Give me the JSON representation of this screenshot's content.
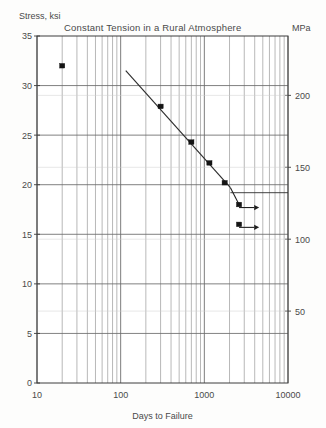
{
  "chart_data": {
    "type": "scatter",
    "title": "Constant Tension in a Rural Atmosphere",
    "xlabel": "Days to Failure",
    "ylabel": "Stress, ksi",
    "y2label": "MPa",
    "xscale": "log",
    "yscale": "linear",
    "xlim": [
      10,
      10000
    ],
    "ylim": [
      0,
      35
    ],
    "y2lim": [
      0,
      241.3
    ],
    "grid": true,
    "legend": "none",
    "xticks": [
      10,
      100,
      1000,
      10000
    ],
    "xtick_labels": [
      "10",
      "100",
      "1000",
      "10000"
    ],
    "yticks": [
      0,
      5,
      10,
      15,
      20,
      25,
      30,
      35
    ],
    "ytick_labels": [
      "0",
      "5",
      "10",
      "15",
      "20",
      "25",
      "30",
      "35"
    ],
    "y2ticks": [
      50,
      100,
      150,
      200
    ],
    "y2tick_labels": [
      "50",
      "100",
      "150",
      "200"
    ],
    "series": [
      {
        "name": "Failures",
        "marker": "filled-square",
        "points": [
          {
            "x": 20,
            "y": 32.0,
            "label": ""
          },
          {
            "x": 300,
            "y": 27.9,
            "label": ""
          },
          {
            "x": 700,
            "y": 24.3,
            "label": ""
          },
          {
            "x": 1150,
            "y": 22.2,
            "label": ""
          },
          {
            "x": 1750,
            "y": 20.2,
            "label": ""
          },
          {
            "x": 2600,
            "y": 18.0,
            "label": ""
          },
          {
            "x": 2600,
            "y": 16.0,
            "label": ""
          }
        ]
      }
    ],
    "trend_line": {
      "name": "Best fit",
      "x_start": 115,
      "y_start": 31.5,
      "x_end": 2050,
      "y_end": 19.7
    },
    "runouts": [
      {
        "x": 2600,
        "y": 18.0,
        "x_arrow_end": 4400,
        "note": "runout arrow"
      },
      {
        "x": 2600,
        "y": 16.0,
        "x_arrow_end": 4400,
        "note": "runout arrow"
      }
    ],
    "annotations": []
  },
  "labels": {
    "title": "Constant Tension in a Rural Atmosphere",
    "y_axis_title": "Stress, ksi",
    "y2_axis_title": "MPa",
    "x_axis_title": "Days to Failure"
  },
  "colors": {
    "background": "#fdfdfc",
    "frame": "#3d3d3d",
    "grid_major": "#6e6e6e",
    "grid_minor": "#9a9a9a",
    "data": "#141414",
    "text": "#4a4a4a"
  }
}
